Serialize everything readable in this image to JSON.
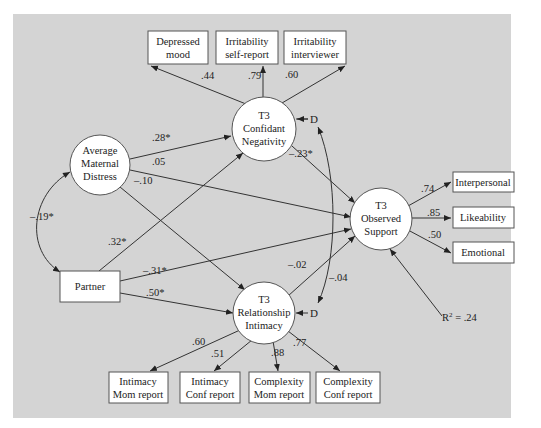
{
  "colors": {
    "panel_bg": "#d4d4d4",
    "node_fill": "#ffffff",
    "stroke": "#333333",
    "text": "#222222"
  },
  "latent": {
    "distress": {
      "lines": [
        "Average",
        "Maternal",
        "Distress"
      ]
    },
    "negativity": {
      "lines": [
        "T3",
        "Confidant",
        "Negativity"
      ]
    },
    "support": {
      "lines": [
        "T3",
        "Observed",
        "Support"
      ]
    },
    "intimacy": {
      "lines": [
        "T3",
        "Relationship",
        "Intimacy"
      ]
    }
  },
  "observed": {
    "depressed": {
      "lines": [
        "Depressed",
        "mood"
      ]
    },
    "irr_self": {
      "lines": [
        "Irritability",
        "self-report"
      ]
    },
    "irr_int": {
      "lines": [
        "Irritability",
        "interviewer"
      ]
    },
    "partner": {
      "lines": [
        "Partner"
      ]
    },
    "interpersonal": {
      "lines": [
        "Interpersonal"
      ]
    },
    "likeability": {
      "lines": [
        "Likeability"
      ]
    },
    "emotional": {
      "lines": [
        "Emotional"
      ]
    },
    "int_mom": {
      "lines": [
        "Intimacy",
        "Mom report"
      ]
    },
    "int_conf": {
      "lines": [
        "Intimacy",
        "Conf report"
      ]
    },
    "comp_mom": {
      "lines": [
        "Complexity",
        "Mom report"
      ]
    },
    "comp_conf": {
      "lines": [
        "Complexity",
        "Conf report"
      ]
    }
  },
  "coefficients": {
    "neg_depressed": ".44",
    "neg_irr_self": ".79",
    "neg_irr_int": ".60",
    "distress_neg": ".28*",
    "distress_support": ".05",
    "distress_intimacy": "–.10",
    "distress_partner_cov": "–.19*",
    "partner_neg": ".32*",
    "partner_support": "–.31*",
    "partner_intimacy": ".50*",
    "neg_support": "–.23*",
    "intimacy_support": "–.02",
    "d_cov": "–.04",
    "support_interpersonal": ".74",
    "support_likeability": ".85",
    "support_emotional": ".50",
    "intimacy_int_mom": ".60",
    "intimacy_int_conf": ".51",
    "intimacy_comp_mom": ".88",
    "intimacy_comp_conf": ".77"
  },
  "disturbance": {
    "neg": "D",
    "intimacy": "D"
  },
  "r_squared": {
    "label": "R",
    "sup": "2",
    "value": " = .24"
  }
}
